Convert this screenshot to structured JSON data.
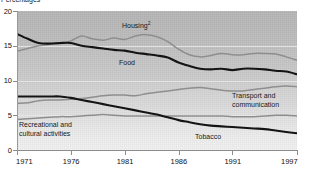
{
  "axis_title": "Percentages",
  "labels": {
    "housing": "Housing",
    "housing_sup": "2",
    "food": "Food",
    "transport_l1": "Transport and",
    "transport_l2": "communication",
    "recreational_l1": "Recreational and",
    "recreational_l2": "cultural activities",
    "tobacco": "Tobacco"
  },
  "colors": {
    "dark_series": "#141414",
    "light_series": "#8e8e8e",
    "plot_bg_top": "#b4b4b4",
    "plot_bg_bottom": "#f1f1f1",
    "gridline": "#e9e9e9",
    "axis": "#8d8d8d"
  },
  "chart_data": {
    "type": "line",
    "title": "",
    "subtitle": "",
    "xlabel": "",
    "ylabel": "Percentages",
    "xlim": [
      1971,
      1997
    ],
    "ylim": [
      0,
      20
    ],
    "yticks": [
      0,
      5,
      10,
      15,
      20
    ],
    "xticks": [
      1971,
      1976,
      1981,
      1986,
      1991,
      1997
    ],
    "grid": true,
    "legend": "in-plot-labels",
    "x": [
      1971,
      1972,
      1973,
      1974,
      1975,
      1976,
      1977,
      1978,
      1979,
      1980,
      1981,
      1982,
      1983,
      1984,
      1985,
      1986,
      1987,
      1988,
      1989,
      1990,
      1991,
      1992,
      1993,
      1994,
      1995,
      1996,
      1997
    ],
    "series": [
      {
        "name": "Housing",
        "color": "#8e8e8e",
        "values": [
          14.2,
          14.6,
          15.0,
          15.2,
          15.3,
          15.7,
          16.4,
          16.0,
          15.8,
          16.1,
          15.9,
          16.4,
          16.6,
          16.3,
          15.6,
          14.5,
          13.7,
          13.4,
          13.6,
          13.9,
          13.7,
          13.7,
          13.9,
          13.9,
          13.8,
          13.4,
          12.9
        ]
      },
      {
        "name": "Food",
        "color": "#141414",
        "values": [
          16.7,
          16.0,
          15.4,
          15.3,
          15.4,
          15.4,
          15.0,
          14.8,
          14.6,
          14.4,
          14.3,
          14.0,
          13.8,
          13.6,
          13.3,
          12.6,
          12.1,
          11.7,
          11.6,
          11.7,
          11.5,
          11.7,
          11.7,
          11.6,
          11.4,
          11.3,
          10.9
        ]
      },
      {
        "name": "Transport and communication",
        "color": "#8e8e8e",
        "values": [
          6.7,
          6.8,
          7.1,
          7.2,
          7.2,
          7.3,
          7.4,
          7.6,
          7.8,
          7.9,
          7.9,
          7.8,
          8.1,
          8.3,
          8.5,
          8.7,
          8.9,
          9.0,
          8.8,
          8.6,
          8.5,
          8.5,
          8.7,
          8.9,
          9.1,
          9.2,
          9.1
        ]
      },
      {
        "name": "Recreational and cultural activities",
        "color": "#8e8e8e",
        "values": [
          4.4,
          4.5,
          4.6,
          4.7,
          4.8,
          4.8,
          4.9,
          5.0,
          5.1,
          5.0,
          4.9,
          4.9,
          4.9,
          4.9,
          4.9,
          4.9,
          4.9,
          4.9,
          4.9,
          4.9,
          4.8,
          4.8,
          4.8,
          4.9,
          5.0,
          5.0,
          4.9
        ]
      },
      {
        "name": "Tobacco",
        "color": "#141414",
        "values": [
          7.7,
          7.7,
          7.7,
          7.7,
          7.7,
          7.5,
          7.2,
          6.9,
          6.6,
          6.3,
          6.0,
          5.7,
          5.4,
          5.1,
          4.7,
          4.3,
          4.0,
          3.7,
          3.5,
          3.4,
          3.3,
          3.2,
          3.1,
          3.0,
          2.8,
          2.6,
          2.4
        ]
      }
    ]
  }
}
